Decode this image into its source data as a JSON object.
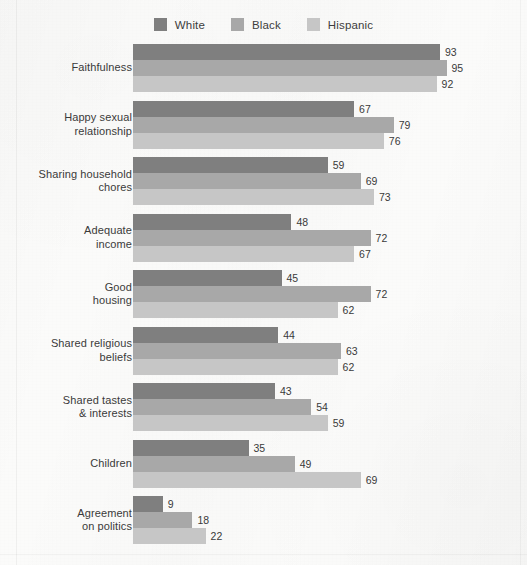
{
  "legend": {
    "items": [
      {
        "label": "White",
        "color": "#7f7f7f"
      },
      {
        "label": "Black",
        "color": "#a8a8a8"
      },
      {
        "label": "Hispanic",
        "color": "#c6c6c6"
      }
    ]
  },
  "chart_data": {
    "type": "bar",
    "orientation": "horizontal",
    "title": "",
    "xlabel": "",
    "ylabel": "",
    "xlim": [
      0,
      100
    ],
    "grid": false,
    "legend_position": "top-center",
    "value_labels": true,
    "categories": [
      "Faithfulness",
      "Happy sexual relationship",
      "Sharing household chores",
      "Adequate income",
      "Good housing",
      "Shared religious beliefs",
      "Shared tastes & interests",
      "Children",
      "Agreement on politics"
    ],
    "category_lines": [
      [
        "Faithfulness"
      ],
      [
        "Happy sexual",
        "relationship"
      ],
      [
        "Sharing household",
        "chores"
      ],
      [
        "Adequate",
        "income"
      ],
      [
        "Good",
        "housing"
      ],
      [
        "Shared religious",
        "beliefs"
      ],
      [
        "Shared tastes",
        "& interests"
      ],
      [
        "Children"
      ],
      [
        "Agreement",
        "on politics"
      ]
    ],
    "series": [
      {
        "name": "White",
        "color": "#7f7f7f",
        "values": [
          93,
          67,
          59,
          48,
          45,
          44,
          43,
          35,
          9
        ]
      },
      {
        "name": "Black",
        "color": "#a8a8a8",
        "values": [
          95,
          79,
          69,
          72,
          72,
          63,
          54,
          49,
          18
        ]
      },
      {
        "name": "Hispanic",
        "color": "#c6c6c6",
        "values": [
          92,
          76,
          73,
          67,
          62,
          62,
          59,
          69,
          22
        ]
      }
    ]
  }
}
